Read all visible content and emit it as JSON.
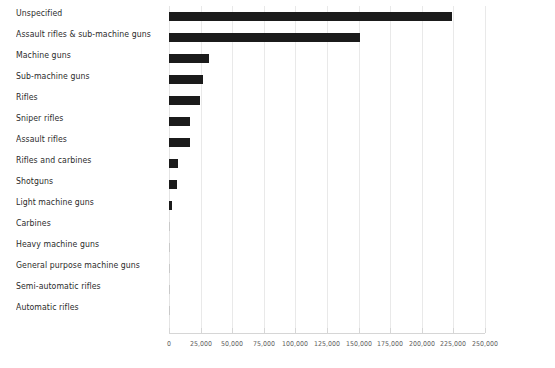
{
  "chart_data": {
    "type": "bar",
    "orientation": "horizontal",
    "title": "",
    "subtitle": "",
    "xlabel": "",
    "ylabel": "",
    "xlim": [
      0,
      250000
    ],
    "grid": true,
    "legend": null,
    "bar_color": "#1b1b1b",
    "gridline_color": "#e9e9e9",
    "axis_color": "#d6d6d6",
    "label_color": "#2b2b2b",
    "tick_label_color": "#636363",
    "x_ticks": [
      0,
      25000,
      50000,
      75000,
      100000,
      125000,
      150000,
      175000,
      200000,
      225000,
      250000
    ],
    "x_tick_labels": [
      "0",
      "25,000",
      "50,000",
      "75,000",
      "100,000",
      "125,000",
      "150,000",
      "175,000",
      "200,000",
      "225,000",
      "250,000"
    ],
    "categories": [
      "Unspecified",
      "Assault rifles & sub-machine guns",
      "Machine guns",
      "Sub-machine guns",
      "Rifles",
      "Sniper rifles",
      "Assault rifles",
      "Rifles and carbines",
      "Shotguns",
      "Light machine guns",
      "Carbines",
      "Heavy machine guns",
      "General purpose machine guns",
      "Semi-automatic rifles",
      "Automatic rifles"
    ],
    "values": [
      224000,
      151500,
      31500,
      27000,
      24500,
      16500,
      16500,
      7000,
      6500,
      2200,
      600,
      500,
      500,
      300,
      200
    ]
  }
}
